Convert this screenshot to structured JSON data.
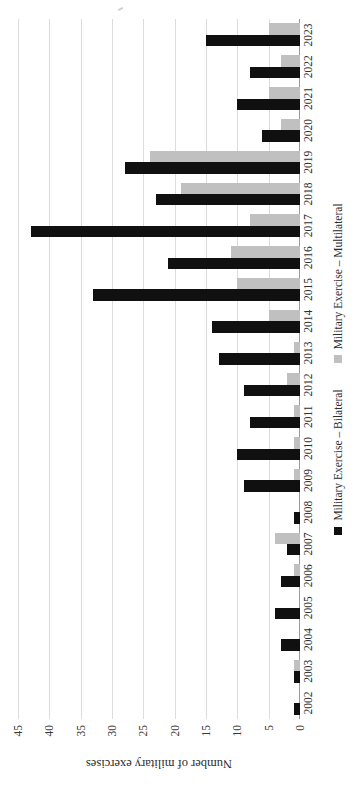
{
  "chart_data": {
    "type": "bar",
    "orientation": "vertical",
    "title": "",
    "subtitle": "",
    "xlabel": "",
    "ylabel": "Number of military exercises",
    "ylim": [
      0,
      45
    ],
    "ytick_step": 5,
    "yticks": [
      "0",
      "5",
      "10",
      "15",
      "20",
      "25",
      "30",
      "35",
      "40",
      "45"
    ],
    "grid": true,
    "legend_position": "bottom",
    "categories": [
      "2002",
      "2003",
      "2004",
      "2005",
      "2006",
      "2007",
      "2008",
      "2009",
      "2010",
      "2011",
      "2012",
      "2013",
      "2014",
      "2015",
      "2016",
      "2017",
      "2018",
      "2019",
      "2020",
      "2021",
      "2022",
      "2023"
    ],
    "series": [
      {
        "name": "Military Exercise – Bilateral",
        "color": "#101010",
        "values": [
          1,
          1,
          3,
          4,
          3,
          2,
          1,
          9,
          10,
          8,
          9,
          13,
          14,
          33,
          21,
          43,
          23,
          28,
          6,
          10,
          8,
          15
        ]
      },
      {
        "name": "Military Exercise – Multilateral",
        "color": "#c0c0c0",
        "values": [
          0,
          1,
          0,
          0,
          1,
          4,
          0,
          1,
          1,
          1,
          2,
          1,
          5,
          10,
          11,
          8,
          19,
          24,
          3,
          5,
          3,
          5
        ]
      }
    ]
  },
  "legend": {
    "items": [
      {
        "label": "Military Exercise – Bilateral",
        "icon": "square-swatch-icon",
        "color": "#101010"
      },
      {
        "label": "Military Exercise – Multilateral",
        "icon": "square-swatch-icon",
        "color": "#c0c0c0"
      }
    ]
  },
  "colors": {
    "bilateral": "#101010",
    "multilateral": "#c0c0c0",
    "gridline": "#dcdcdc",
    "axis": "#9a9a9a",
    "text": "#2b2b2b",
    "background": "#ffffff"
  }
}
